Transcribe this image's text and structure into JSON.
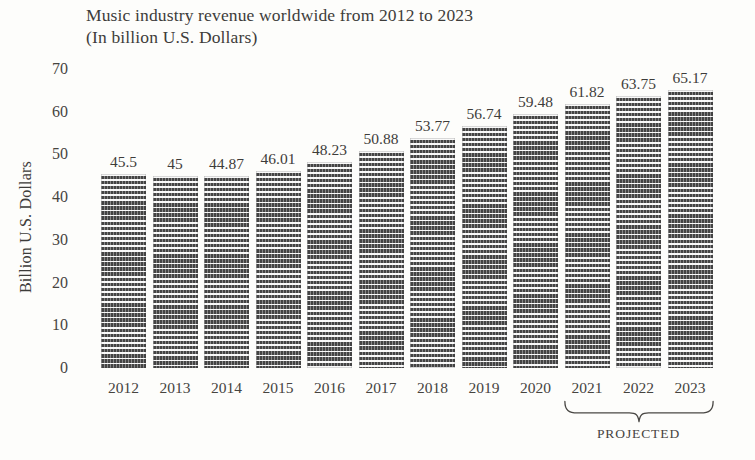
{
  "chart_data": {
    "type": "bar",
    "title": "Music industry revenue worldwide from 2012 to 2023",
    "subtitle": "(In billion U.S. Dollars)",
    "xlabel": "",
    "ylabel": "Billion U.S. Dollars",
    "categories": [
      "2012",
      "2013",
      "2014",
      "2015",
      "2016",
      "2017",
      "2018",
      "2019",
      "2020",
      "2021",
      "2022",
      "2023"
    ],
    "values": [
      45.5,
      45,
      44.87,
      46.01,
      48.23,
      50.88,
      53.77,
      56.74,
      59.48,
      61.82,
      63.75,
      65.17
    ],
    "value_labels": [
      "45.5",
      "45",
      "44.87",
      "46.01",
      "48.23",
      "50.88",
      "53.77",
      "56.74",
      "59.48",
      "61.82",
      "63.75",
      "65.17"
    ],
    "ylim": [
      0,
      70
    ],
    "yticks": [
      70,
      60,
      50,
      40,
      30,
      20,
      10,
      0
    ],
    "ytick_labels": [
      "70",
      "60",
      "50",
      "40",
      "30",
      "20",
      "10",
      "0"
    ],
    "grid": false,
    "legend": null,
    "annotations": [
      {
        "text": "PROJECTED",
        "covers_categories": [
          "2021",
          "2022",
          "2023"
        ],
        "style": "curly-brace-below-axis"
      }
    ],
    "bar_style": {
      "fill": "#4b4b4b",
      "pattern": "horizontal-hatch"
    },
    "background": "#fdfdfb"
  }
}
